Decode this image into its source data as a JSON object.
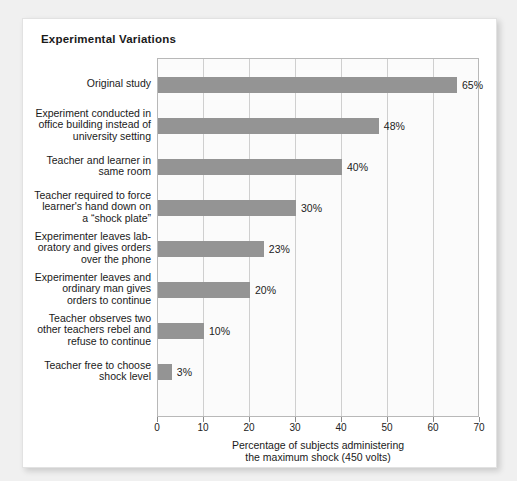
{
  "card": {
    "title": "Experimental Variations"
  },
  "chart_data": {
    "type": "bar",
    "orientation": "horizontal",
    "title": "Experimental Variations",
    "xlabel": "Percentage of subjects administering\nthe maximum shock (450 volts)",
    "ylabel": "",
    "xlim": [
      0,
      70
    ],
    "xticks": [
      0,
      10,
      20,
      30,
      40,
      50,
      60,
      70
    ],
    "xtick_labels": [
      "0",
      "10",
      "20",
      "30",
      "40",
      "50",
      "60",
      "70"
    ],
    "grid": true,
    "legend": false,
    "bar_color": "#949494",
    "categories": [
      "Original study",
      "Experiment conducted in\noffice building instead of\nuniversity setting",
      "Teacher and learner in\nsame room",
      "Teacher required to force\nlearner's hand down on\na “shock plate”",
      "Experimenter leaves lab-\noratory and gives orders\nover the phone",
      "Experimenter leaves and\nordinary man gives\norders to continue",
      "Teacher observes two\nother teachers rebel and\nrefuse to continue",
      "Teacher free to choose\nshock level"
    ],
    "values": [
      65,
      48,
      40,
      30,
      23,
      20,
      10,
      3
    ],
    "value_labels": [
      "65%",
      "48%",
      "40%",
      "30%",
      "23%",
      "20%",
      "10%",
      "3%"
    ]
  }
}
